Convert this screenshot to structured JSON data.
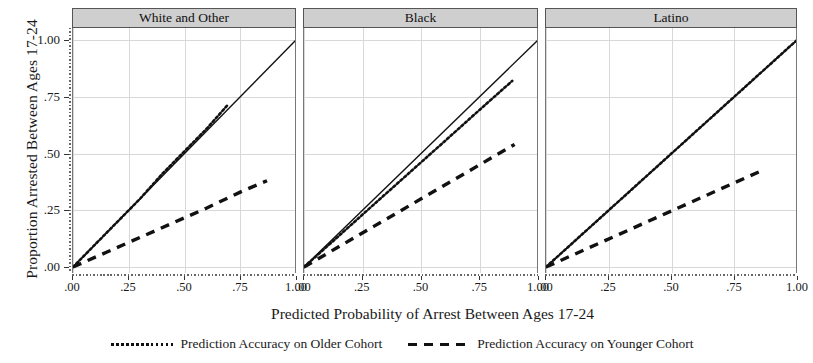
{
  "chart_data": {
    "type": "line",
    "title": "",
    "xlabel": "Predicted Probability of Arrest Between Ages 17-24",
    "ylabel": "Proportion Arrested Between Ages 17-24",
    "xlim": [
      0,
      1
    ],
    "ylim": [
      0,
      1
    ],
    "grid": true,
    "legend_position": "bottom",
    "x_ticks": [
      ".00",
      ".25",
      ".50",
      ".75",
      "1.00"
    ],
    "x_tick_values": [
      0,
      0.25,
      0.5,
      0.75,
      1.0
    ],
    "y_ticks": [
      ".00",
      ".25",
      ".50",
      ".75",
      "1.00"
    ],
    "y_tick_values": [
      0,
      0.25,
      0.5,
      0.75,
      1.0
    ],
    "legend": [
      {
        "name": "Prediction Accuracy on Older Cohort",
        "style": "dotted"
      },
      {
        "name": "Prediction Accuracy on Younger Cohort",
        "style": "dashed"
      }
    ],
    "panels": [
      {
        "label": "White and Other",
        "series": [
          {
            "name": "Reference diagonal",
            "style": "solid",
            "x": [
              0.0,
              1.0
            ],
            "y": [
              0.0,
              1.0
            ]
          },
          {
            "name": "Prediction Accuracy on Older Cohort",
            "style": "dotted",
            "x": [
              0.0,
              0.1,
              0.2,
              0.3,
              0.4,
              0.5,
              0.6,
              0.69
            ],
            "y": [
              0.0,
              0.1,
              0.2,
              0.3,
              0.41,
              0.51,
              0.61,
              0.71
            ]
          },
          {
            "name": "Prediction Accuracy on Younger Cohort",
            "style": "dashed",
            "x": [
              0.0,
              0.15,
              0.3,
              0.45,
              0.6,
              0.75,
              0.87
            ],
            "y": [
              0.0,
              0.065,
              0.13,
              0.195,
              0.26,
              0.33,
              0.38
            ]
          }
        ]
      },
      {
        "label": "Black",
        "series": [
          {
            "name": "Reference diagonal",
            "style": "solid",
            "x": [
              0.0,
              1.0
            ],
            "y": [
              0.0,
              1.0
            ]
          },
          {
            "name": "Prediction Accuracy on Older Cohort",
            "style": "dotted",
            "x": [
              0.0,
              0.15,
              0.3,
              0.45,
              0.6,
              0.75,
              0.89
            ],
            "y": [
              0.0,
              0.138,
              0.277,
              0.415,
              0.553,
              0.692,
              0.82
            ]
          },
          {
            "name": "Prediction Accuracy on Younger Cohort",
            "style": "dashed",
            "x": [
              0.0,
              0.15,
              0.3,
              0.45,
              0.6,
              0.75,
              0.9
            ],
            "y": [
              0.0,
              0.09,
              0.18,
              0.27,
              0.36,
              0.45,
              0.54
            ]
          }
        ]
      },
      {
        "label": "Latino",
        "series": [
          {
            "name": "Reference diagonal",
            "style": "solid",
            "x": [
              0.0,
              1.0
            ],
            "y": [
              0.0,
              1.0
            ]
          },
          {
            "name": "Prediction Accuracy on Older Cohort",
            "style": "dotted",
            "x": [
              0.0,
              0.2,
              0.4,
              0.6,
              0.8,
              1.0
            ],
            "y": [
              0.0,
              0.2,
              0.4,
              0.6,
              0.8,
              1.0
            ]
          },
          {
            "name": "Prediction Accuracy on Younger Cohort",
            "style": "dashed",
            "x": [
              0.0,
              0.17,
              0.34,
              0.51,
              0.68,
              0.85
            ],
            "y": [
              0.0,
              0.084,
              0.168,
              0.252,
              0.336,
              0.42
            ]
          }
        ]
      }
    ]
  },
  "colors": {
    "panel_strip": "#cfcfcf",
    "grid": "#d8d8d8",
    "line": "#111111",
    "axis": "#555555"
  }
}
